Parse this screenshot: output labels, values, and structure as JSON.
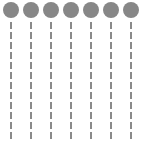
{
  "figure": {
    "width": 144,
    "height": 148,
    "background_color": "#ffffff",
    "circle_color": "#878787",
    "line_color": "#8a8a8a",
    "circle_count": 7,
    "line_count": 7,
    "circle_diameter": 16,
    "line_width": 2,
    "line_style": "dashed",
    "dash_length": 7,
    "dash_gap": 3,
    "column_spacing": 20,
    "columns": [
      {
        "index": 1,
        "label": "",
        "center_x": 11,
        "circle_center_y": 10,
        "line_top": 22,
        "line_bottom": 139
      },
      {
        "index": 2,
        "label": "",
        "center_x": 31,
        "circle_center_y": 10,
        "line_top": 22,
        "line_bottom": 139
      },
      {
        "index": 3,
        "label": "",
        "center_x": 51,
        "circle_center_y": 10,
        "line_top": 22,
        "line_bottom": 139
      },
      {
        "index": 4,
        "label": "",
        "center_x": 71,
        "circle_center_y": 10,
        "line_top": 22,
        "line_bottom": 139
      },
      {
        "index": 5,
        "label": "",
        "center_x": 91,
        "circle_center_y": 10,
        "line_top": 22,
        "line_bottom": 139
      },
      {
        "index": 6,
        "label": "",
        "center_x": 111,
        "circle_center_y": 10,
        "line_top": 22,
        "line_bottom": 139
      },
      {
        "index": 7,
        "label": "",
        "center_x": 131,
        "circle_center_y": 10,
        "line_top": 22,
        "line_bottom": 139
      }
    ]
  }
}
